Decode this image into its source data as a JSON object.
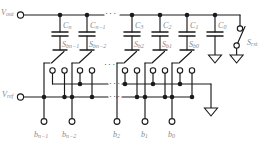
{
  "figure": {
    "kind": "circuit-schematic",
    "colors": {
      "wire": "#1a1a1a",
      "label": "#8a8a8a",
      "background": "#ffffff"
    }
  },
  "terminals": {
    "vout": {
      "label": "V",
      "sub": "out"
    },
    "vref": {
      "label": "V",
      "sub": "ref"
    }
  },
  "capacitors": [
    {
      "name": "C",
      "sub": "n",
      "x": 60
    },
    {
      "name": "C",
      "sub": "n−1",
      "x": 87
    },
    {
      "name": "C",
      "sub": "3",
      "x": 132
    },
    {
      "name": "C",
      "sub": "2",
      "x": 160
    },
    {
      "name": "C",
      "sub": "1",
      "x": 187
    },
    {
      "name": "C",
      "sub": "0",
      "x": 215
    }
  ],
  "switches": [
    {
      "name": "S",
      "sub": "bn−1",
      "x": 60
    },
    {
      "name": "S",
      "sub": "bn−2",
      "x": 87
    },
    {
      "name": "S",
      "sub": "b2",
      "x": 132
    },
    {
      "name": "S",
      "sub": "b1",
      "x": 160
    },
    {
      "name": "S",
      "sub": "b0",
      "x": 187
    }
  ],
  "reset_switch": {
    "name": "S",
    "sub": "rst"
  },
  "bit_inputs": [
    {
      "name": "b",
      "sub": "n−1",
      "x": 44
    },
    {
      "name": "b",
      "sub": "n−2",
      "x": 72
    },
    {
      "name": "b",
      "sub": "2",
      "x": 117
    },
    {
      "name": "b",
      "sub": "1",
      "x": 145
    },
    {
      "name": "b",
      "sub": "0",
      "x": 172
    }
  ],
  "ellipses": [
    {
      "id": "top-rail-gap",
      "glyph": "···"
    },
    {
      "id": "gnd-bus-gap",
      "glyph": "···"
    },
    {
      "id": "vref-bus-gap",
      "glyph": "···"
    },
    {
      "id": "switch-row-gap",
      "glyph": "···"
    }
  ],
  "grounds": [
    {
      "id": "c0-ground"
    },
    {
      "id": "reset-ground"
    },
    {
      "id": "bus-ground"
    }
  ]
}
